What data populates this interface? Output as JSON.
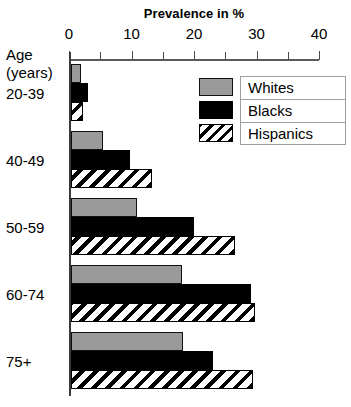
{
  "chart_data": {
    "type": "bar",
    "orientation": "horizontal",
    "title": "Prevalence in %",
    "xlabel": "Prevalence in %",
    "ylabel": "Age (years)",
    "ylabel_lines": [
      "Age",
      "(years)"
    ],
    "xlim": [
      0,
      40
    ],
    "xticks": [
      0,
      10,
      20,
      30,
      40
    ],
    "xtick_labels": [
      "0",
      "10",
      "20",
      "30",
      "40"
    ],
    "xticks_minor": [
      5,
      15,
      25,
      35
    ],
    "grid": false,
    "legend_position": "upper-right",
    "categories": [
      "20-39",
      "40-49",
      "50-59",
      "60-74",
      "75+"
    ],
    "series": [
      {
        "name": "Whites",
        "color": "#9a9a9a",
        "fill": "solid-gray",
        "values": [
          1.6,
          5.1,
          10.6,
          17.8,
          17.9
        ]
      },
      {
        "name": "Blacks",
        "color": "#000000",
        "fill": "solid-black",
        "values": [
          2.7,
          9.5,
          19.7,
          28.8,
          22.7
        ]
      },
      {
        "name": "Hispanics",
        "color": "#ffffff",
        "fill": "diagonal-hatch",
        "values": [
          1.9,
          12.9,
          26.2,
          29.5,
          29.1
        ]
      }
    ]
  },
  "legend": {
    "items": [
      {
        "label": "Whites"
      },
      {
        "label": "Blacks"
      },
      {
        "label": "Hispanics"
      }
    ]
  },
  "colors": {
    "whites": "#9a9a9a",
    "blacks": "#000000",
    "hispanics": "#ffffff",
    "axis": "#3a3a3a",
    "background": "#ffffff"
  }
}
